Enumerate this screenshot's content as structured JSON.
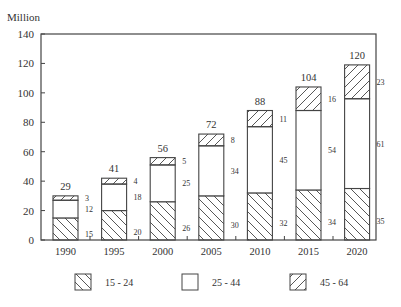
{
  "chart_data": {
    "type": "bar",
    "stacked": true,
    "title": "",
    "ylabel": "Million",
    "xlabel": "",
    "ylim": [
      0,
      140
    ],
    "yticks": [
      0,
      20,
      40,
      60,
      80,
      100,
      120,
      140
    ],
    "categories": [
      "1990",
      "1995",
      "2000",
      "2005",
      "2010",
      "2015",
      "2020"
    ],
    "series": [
      {
        "name": "15 - 24",
        "pattern": "back-diagonal-hatch",
        "values": [
          15,
          20,
          26,
          30,
          32,
          34,
          35
        ]
      },
      {
        "name": "25 - 44",
        "pattern": "empty",
        "values": [
          12,
          18,
          25,
          34,
          45,
          54,
          61
        ]
      },
      {
        "name": "45 - 64",
        "pattern": "forward-diagonal-hatch",
        "values": [
          3,
          4,
          5,
          8,
          11,
          16,
          23
        ]
      }
    ],
    "totals": [
      29,
      41,
      56,
      72,
      88,
      104,
      120
    ],
    "grid": false,
    "legend_position": "bottom"
  },
  "colors": {
    "axis": "#444444",
    "bar_stroke": "#444444",
    "hatch": "#444444",
    "text": "#333333"
  }
}
